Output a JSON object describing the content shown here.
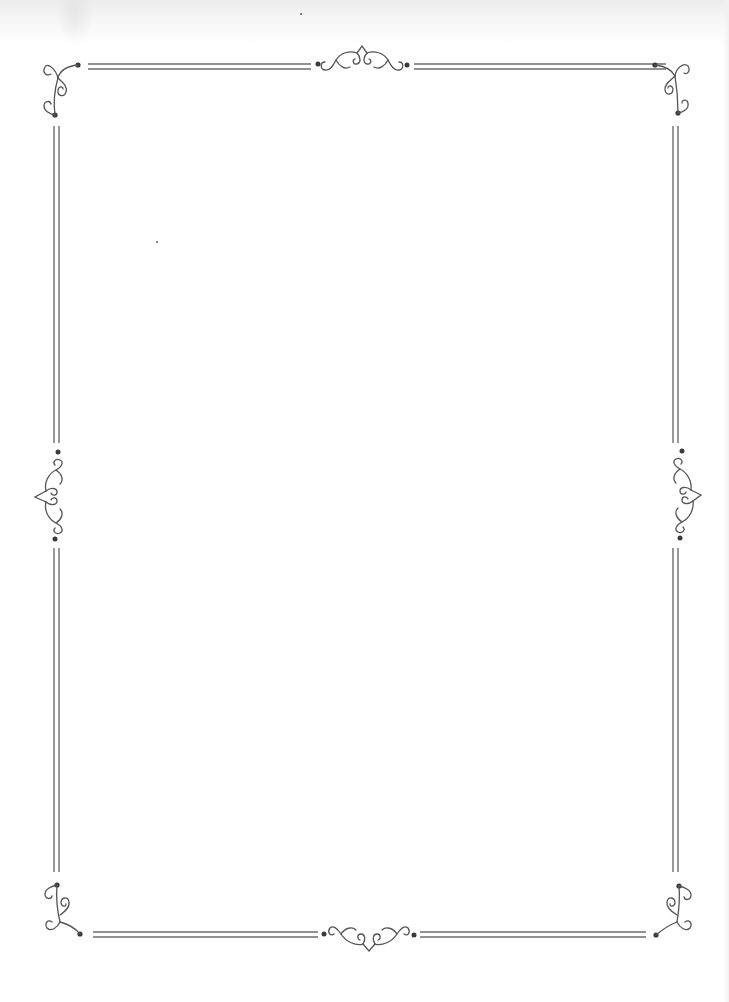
{
  "page": {
    "type": "decorative-border-frame",
    "background": "#ffffff",
    "line_color": "#6e6e6e",
    "ornament_color": "#555555",
    "dot_color": "#3a3a3a",
    "width": 729,
    "height": 1002
  },
  "border": {
    "style": "double-line",
    "top_lines_y": [
      64,
      69
    ],
    "bottom_lines_y": [
      932,
      937
    ],
    "left_lines_x": [
      54,
      59
    ],
    "right_lines_x": [
      673,
      678
    ]
  },
  "ornaments": [
    {
      "position": "top-left-corner",
      "icon": "scroll-flourish-icon"
    },
    {
      "position": "top-right-corner",
      "icon": "scroll-flourish-icon"
    },
    {
      "position": "bottom-left-corner",
      "icon": "scroll-flourish-icon"
    },
    {
      "position": "bottom-right-corner",
      "icon": "scroll-flourish-icon"
    },
    {
      "position": "top-center",
      "icon": "scroll-diamond-icon"
    },
    {
      "position": "bottom-center",
      "icon": "scroll-diamond-icon"
    },
    {
      "position": "left-middle",
      "icon": "scroll-diamond-icon"
    },
    {
      "position": "right-middle",
      "icon": "scroll-diamond-icon"
    }
  ]
}
